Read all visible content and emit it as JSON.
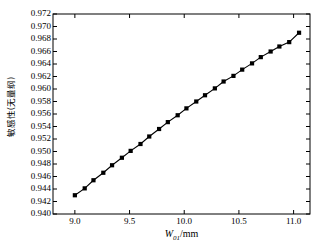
{
  "chart_data": {
    "type": "line",
    "title": "",
    "xlabel": "W01/mm",
    "xlabel_base": "W",
    "xlabel_sub": "01",
    "xlabel_unit": "/mm",
    "ylabel": "敏感性(无量纲)",
    "xlim": [
      8.8,
      11.15
    ],
    "ylim": [
      0.94,
      0.972
    ],
    "xticks": [
      "9.0",
      "9.5",
      "10.0",
      "10.5",
      "11.0"
    ],
    "xtick_values": [
      9.0,
      9.5,
      10.0,
      10.5,
      11.0
    ],
    "yticks": [
      "0.972",
      "0.970",
      "0.968",
      "0.966",
      "0.964",
      "0.962",
      "0.960",
      "0.958",
      "0.956",
      "0.954",
      "0.952",
      "0.950",
      "0.948",
      "0.946",
      "0.944",
      "0.942",
      "0.940"
    ],
    "ytick_values": [
      0.972,
      0.97,
      0.968,
      0.966,
      0.964,
      0.962,
      0.96,
      0.958,
      0.956,
      0.954,
      0.952,
      0.95,
      0.948,
      0.946,
      0.944,
      0.942,
      0.94
    ],
    "grid": false,
    "legend": "none",
    "marker": "square",
    "marker_color": "#000000",
    "line_color": "#000000",
    "series": [
      {
        "name": "sensitivity",
        "x": [
          9.0,
          9.09,
          9.17,
          9.26,
          9.34,
          9.43,
          9.51,
          9.6,
          9.68,
          9.77,
          9.85,
          9.94,
          10.02,
          10.11,
          10.19,
          10.28,
          10.36,
          10.45,
          10.53,
          10.62,
          10.7,
          10.79,
          10.87,
          10.96,
          11.05
        ],
        "y": [
          0.943,
          0.9441,
          0.9454,
          0.9466,
          0.9478,
          0.949,
          0.9501,
          0.9512,
          0.9524,
          0.9536,
          0.9547,
          0.9558,
          0.9569,
          0.958,
          0.959,
          0.9601,
          0.9612,
          0.9621,
          0.9631,
          0.9641,
          0.9651,
          0.966,
          0.9668,
          0.9675,
          0.969
        ]
      }
    ]
  },
  "axes": {
    "frame_color": "#000000"
  }
}
